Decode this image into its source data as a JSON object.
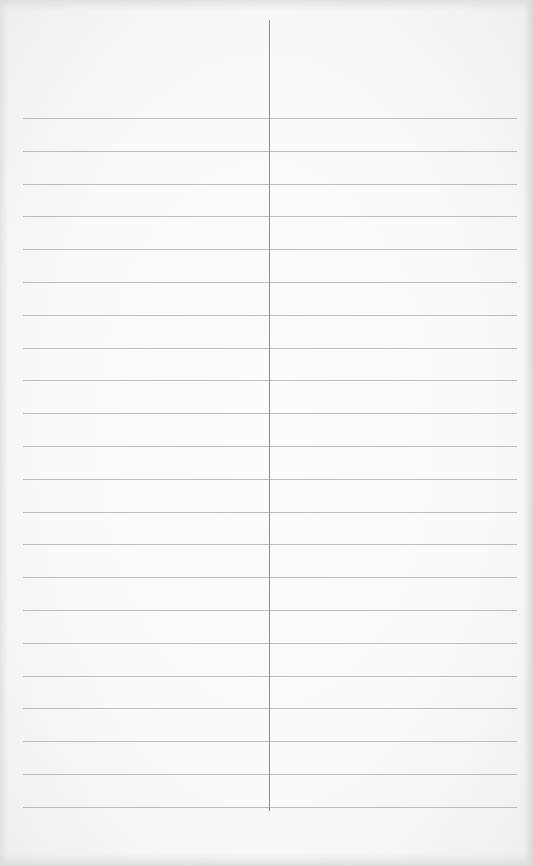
{
  "page": {
    "type": "blank two-column lined sheet",
    "columns": 2,
    "line_count": 22,
    "content": []
  },
  "layout_colors": {
    "background": "#f9f9f8",
    "horizontal_rule": "#bcbcbc",
    "vertical_divider": "#8c8c8c"
  },
  "rows": [
    {
      "left": "",
      "right": ""
    },
    {
      "left": "",
      "right": ""
    },
    {
      "left": "",
      "right": ""
    },
    {
      "left": "",
      "right": ""
    },
    {
      "left": "",
      "right": ""
    },
    {
      "left": "",
      "right": ""
    },
    {
      "left": "",
      "right": ""
    },
    {
      "left": "",
      "right": ""
    },
    {
      "left": "",
      "right": ""
    },
    {
      "left": "",
      "right": ""
    },
    {
      "left": "",
      "right": ""
    },
    {
      "left": "",
      "right": ""
    },
    {
      "left": "",
      "right": ""
    },
    {
      "left": "",
      "right": ""
    },
    {
      "left": "",
      "right": ""
    },
    {
      "left": "",
      "right": ""
    },
    {
      "left": "",
      "right": ""
    },
    {
      "left": "",
      "right": ""
    },
    {
      "left": "",
      "right": ""
    },
    {
      "left": "",
      "right": ""
    },
    {
      "left": "",
      "right": ""
    },
    {
      "left": "",
      "right": ""
    }
  ]
}
